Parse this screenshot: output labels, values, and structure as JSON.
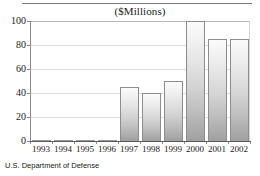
{
  "chart_data": {
    "type": "bar",
    "title": "($Millions)",
    "xlabel": "",
    "ylabel": "",
    "categories": [
      "1993",
      "1994",
      "1995",
      "1996",
      "1997",
      "1998",
      "1999",
      "2000",
      "2001",
      "2002"
    ],
    "values": [
      0,
      0,
      0,
      0,
      45,
      40,
      50,
      100,
      85,
      85
    ],
    "ylim": [
      0,
      100
    ],
    "yticks": [
      0,
      20,
      40,
      60,
      80,
      100
    ],
    "ytick_labels": [
      "0",
      "20",
      "40",
      "60",
      "80",
      "100"
    ],
    "grid": true,
    "legend": null,
    "source_note": "U.S. Department of Defense",
    "bar_fill_top": "#fbfbfb",
    "bar_fill_bottom": "#a0a0a0",
    "bar_border": "#8d8d8d",
    "axis_color": "#8c8c8c",
    "text_color": "#1a1a1a"
  }
}
